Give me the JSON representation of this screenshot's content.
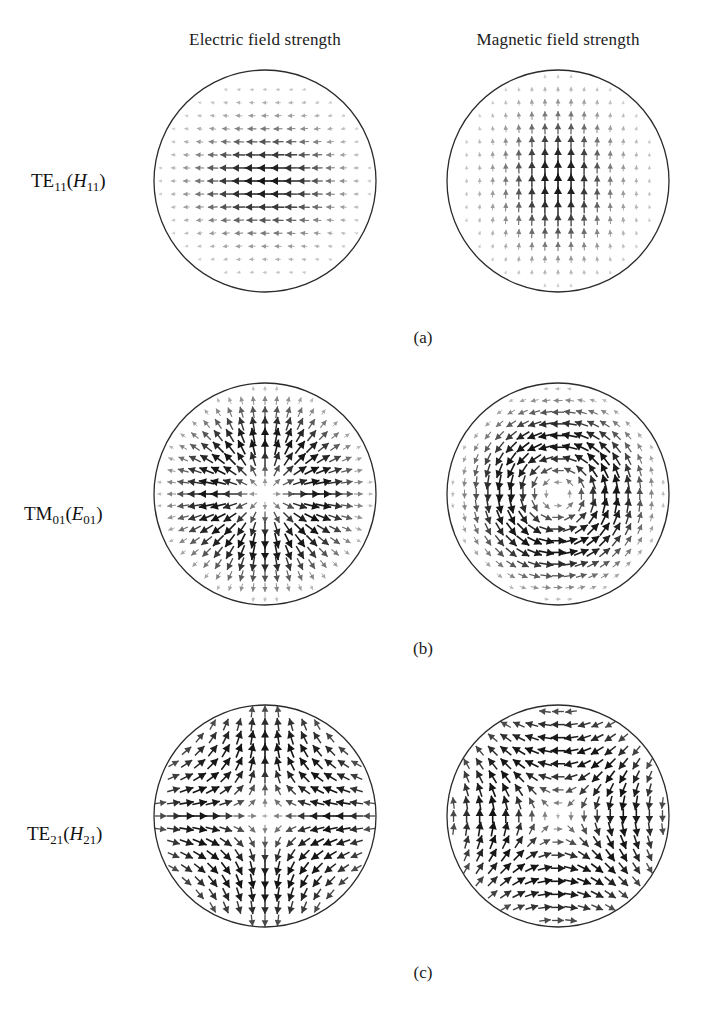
{
  "figure": {
    "type": "vector-field-plot-grid",
    "columns": [
      {
        "key": "electric",
        "label": "Electric field strength"
      },
      {
        "key": "magnetic",
        "label": "Magnetic field strength"
      }
    ],
    "rows": [
      {
        "key": "te11",
        "label_main": "TE",
        "label_sub": "11",
        "label_paren_italic": "H",
        "label_paren_sub": "11",
        "caption": "(a)"
      },
      {
        "key": "tm01",
        "label_main": "TM",
        "label_sub": "01",
        "label_paren_italic": "E",
        "label_paren_sub": "01",
        "caption": "(b)"
      },
      {
        "key": "te21",
        "label_main": "TE",
        "label_sub": "21",
        "label_paren_italic": "H",
        "label_paren_sub": "21",
        "caption": "(c)"
      }
    ]
  },
  "chart_data": {
    "type": "scatter",
    "title": "",
    "xlabel": "",
    "ylabel": "",
    "plot_style": "quiver / vector arrows on polar sample grid inside a circular boundary",
    "grid": false,
    "legend": false,
    "boundary": {
      "shape": "circle",
      "stroke": "#2b2b2b",
      "stroke_width": 1.3,
      "fill": "none"
    },
    "arrow_color_min": "#d8d8d8",
    "arrow_color_max": "#1a1a1a",
    "panels": [
      {
        "id": "te11-E",
        "row": "te11",
        "column": "electric",
        "field": "E",
        "mode": "TE11",
        "pattern": "transverse dipole; arrows point in -x, magnitude peaks along horizontal mid-line and decays toward top and bottom walls, fanning near the boundary",
        "formula": "Ex ~ -(J1(k r)/r) style TE11 transverse field, arrows mostly -x",
        "cx": 265,
        "cy": 181,
        "r": 111,
        "grid_nx": 17,
        "grid_ny": 17,
        "max_arrow_len": 15
      },
      {
        "id": "te11-H",
        "row": "te11",
        "column": "magnetic",
        "field": "H",
        "mode": "TE11",
        "pattern": "transverse dipole rotated 90 degrees from E; arrows point in +y, magnitude peaks near the vertical centre band",
        "formula": "Hy perpendicular to E of TE11",
        "cx": 558,
        "cy": 181,
        "r": 111,
        "grid_nx": 17,
        "grid_ny": 17,
        "max_arrow_len": 15
      },
      {
        "id": "tm01-E",
        "row": "tm01",
        "column": "electric",
        "field": "E",
        "mode": "TM01",
        "pattern": "purely radial, pointing outward from the centre, magnitude zero at the axis and maximum at the wall",
        "formula": "Er ~ J1(k r) radial outward",
        "cx": 265,
        "cy": 494,
        "r": 111,
        "grid_nx": 19,
        "grid_ny": 19,
        "max_arrow_len": 16
      },
      {
        "id": "tm01-H",
        "row": "tm01",
        "column": "magnetic",
        "field": "H",
        "mode": "TM01",
        "pattern": "purely azimuthal circulation about the centre, magnitude zero at the axis and maximum near the wall",
        "formula": "Hphi ~ J1(k r) circulating",
        "cx": 558,
        "cy": 494,
        "r": 111,
        "grid_nx": 19,
        "grid_ny": 19,
        "max_arrow_len": 16
      },
      {
        "id": "te21-E",
        "row": "te21",
        "column": "electric",
        "field": "E",
        "mode": "TE21",
        "pattern": "quadrupole: arrows converge downward at the top, upward at the bottom, leftward on the left and rightward on the right, forming four lobes",
        "formula": "TE21 transverse E, cos(2 phi) angular dependence",
        "cx": 265,
        "cy": 816,
        "r": 111,
        "grid_nx": 17,
        "grid_ny": 17,
        "max_arrow_len": 15
      },
      {
        "id": "te21-H",
        "row": "te21",
        "column": "magnetic",
        "field": "H",
        "mode": "TE21",
        "pattern": "quadrupole rotated 45 degrees relative to E; four circulation cells with strongest arrows near the wall and at the diagonals",
        "formula": "TE21 transverse H, sin(2 phi) angular dependence",
        "cx": 558,
        "cy": 816,
        "r": 111,
        "grid_nx": 17,
        "grid_ny": 17,
        "max_arrow_len": 15
      }
    ]
  }
}
